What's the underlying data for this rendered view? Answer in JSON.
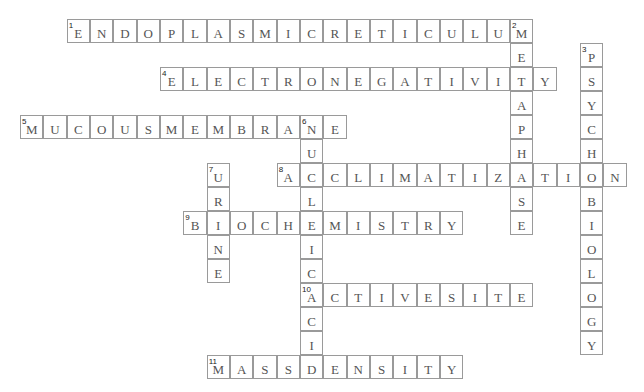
{
  "puzzle": {
    "origin": {
      "x": 20,
      "y": 19
    },
    "cell_w": 23.33,
    "cell_h": 24,
    "colors": {
      "border": "#9a9a9a",
      "letter": "#555555",
      "number": "#222222",
      "background": "#ffffff"
    },
    "words": [
      {
        "number": 1,
        "direction": "across",
        "row": 0,
        "col": 2,
        "answer": "ENDOPLASMICRETICULUM"
      },
      {
        "number": 2,
        "direction": "down",
        "row": 0,
        "col": 21,
        "answer": "METAPHASE"
      },
      {
        "number": 3,
        "direction": "down",
        "row": 1,
        "col": 24,
        "answer": "PSYCHOBIOLOGY"
      },
      {
        "number": 4,
        "direction": "across",
        "row": 2,
        "col": 6,
        "answer": "ELECTRONEGATIVITY"
      },
      {
        "number": 5,
        "direction": "across",
        "row": 4,
        "col": 0,
        "answer": "MUCOUSMEMBRANE"
      },
      {
        "number": 6,
        "direction": "down",
        "row": 4,
        "col": 12,
        "answer": "NUCLEICACID"
      },
      {
        "number": 7,
        "direction": "down",
        "row": 6,
        "col": 8,
        "answer": "URINE"
      },
      {
        "number": 8,
        "direction": "across",
        "row": 6,
        "col": 11,
        "answer": "ACCLIMATIZATION"
      },
      {
        "number": 9,
        "direction": "across",
        "row": 8,
        "col": 7,
        "answer": "BIOCHEMISTRY"
      },
      {
        "number": 10,
        "direction": "across",
        "row": 11,
        "col": 12,
        "answer": "ACTIVESITE"
      },
      {
        "number": 11,
        "direction": "across",
        "row": 14,
        "col": 8,
        "answer": "MASSDENSITY"
      }
    ]
  }
}
